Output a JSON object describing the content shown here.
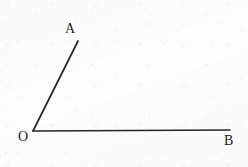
{
  "figure": {
    "type": "geometric-angle-diagram",
    "canvas": {
      "width": 248,
      "height": 167
    },
    "background_color": "#fdfdfd",
    "stroke_color": "#262626",
    "stroke_width": 1.6,
    "text_color": "#1d1d1d"
  },
  "labels": {
    "a": "A",
    "o": "O",
    "b": "B"
  },
  "geometry": {
    "vertex": {
      "name": "O",
      "x": 33,
      "y": 131
    },
    "rays": [
      {
        "name": "ray-OA",
        "from": {
          "x": 33,
          "y": 131
        },
        "to": {
          "x": 78,
          "y": 41
        },
        "endpoint_label": "A"
      },
      {
        "name": "ray-OB",
        "from": {
          "x": 33,
          "y": 131
        },
        "to": {
          "x": 230,
          "y": 130
        },
        "endpoint_label": "B"
      }
    ]
  }
}
